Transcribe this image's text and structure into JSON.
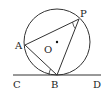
{
  "diagram": {
    "type": "geometry",
    "circle": {
      "center_label": "O",
      "cx": 57,
      "cy": 42,
      "r": 33
    },
    "points": [
      {
        "label": "A",
        "x": 25,
        "y": 45
      },
      {
        "label": "P",
        "x": 79,
        "y": 19
      },
      {
        "label": "B",
        "x": 57,
        "y": 75
      },
      {
        "label": "C",
        "x": 13,
        "y": 75
      },
      {
        "label": "D",
        "x": 100,
        "y": 75
      }
    ],
    "segments": [
      "AP",
      "PB",
      "AB",
      "CD"
    ],
    "tangent_line": "CD at B",
    "angle_marks": [
      "APB",
      "ABC"
    ],
    "labels": {
      "A": "A",
      "P": "P",
      "B": "B",
      "C": "C",
      "D": "D",
      "O": "O"
    },
    "stroke_color": "#333333"
  }
}
